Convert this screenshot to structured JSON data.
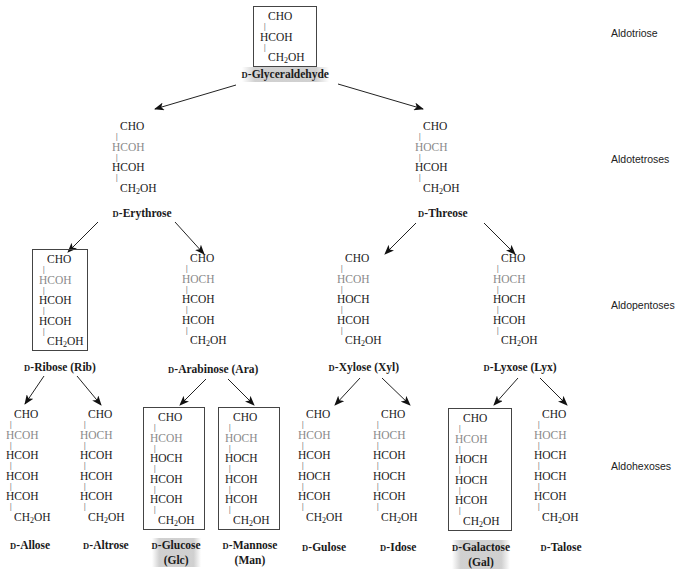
{
  "levels": [
    {
      "label": "Aldotriose",
      "x": 611,
      "y": 27
    },
    {
      "label": "Aldotetroses",
      "x": 611,
      "y": 153
    },
    {
      "label": "Aldopentoses",
      "x": 611,
      "y": 299
    },
    {
      "label": "Aldohexoses",
      "x": 611,
      "y": 460
    }
  ],
  "molecules": [
    {
      "id": "glyceraldehyde",
      "prefix": "D",
      "name": "-Glyceraldehyde",
      "abbr": "",
      "boxed": true,
      "shaded": true,
      "rows": [
        {
          "text": "CHO",
          "h": false,
          "indent": 2
        },
        {
          "text": "HCOH",
          "h": false,
          "indent": 0
        },
        {
          "text": "CH2OH",
          "h": false,
          "indent": 2
        }
      ],
      "x": 253,
      "y": 6,
      "boxw": 64,
      "name_x": 285,
      "name_y": 67
    },
    {
      "id": "erythrose",
      "prefix": "D",
      "name": "-Erythrose",
      "abbr": "",
      "boxed": false,
      "shaded": false,
      "rows": [
        {
          "text": "CHO",
          "h": false,
          "indent": 2
        },
        {
          "text": "HCOH",
          "h": true,
          "indent": 0
        },
        {
          "text": "HCOH",
          "h": false,
          "indent": 0
        },
        {
          "text": "CH2OH",
          "h": false,
          "indent": 2
        }
      ],
      "x": 112,
      "y": 120,
      "boxw": 0,
      "name_x": 142,
      "name_y": 206
    },
    {
      "id": "threose",
      "prefix": "D",
      "name": "-Threose",
      "abbr": "",
      "boxed": false,
      "shaded": false,
      "rows": [
        {
          "text": "CHO",
          "h": false,
          "indent": 2
        },
        {
          "text": "HOCH",
          "h": true,
          "indent": 0
        },
        {
          "text": "HCOH",
          "h": false,
          "indent": 0
        },
        {
          "text": "CH2OH",
          "h": false,
          "indent": 2
        }
      ],
      "x": 415,
      "y": 120,
      "boxw": 0,
      "name_x": 443,
      "name_y": 206
    },
    {
      "id": "ribose",
      "prefix": "D",
      "name": "-Ribose (Rib)",
      "abbr": "",
      "boxed": true,
      "shaded": false,
      "rows": [
        {
          "text": "CHO",
          "h": false,
          "indent": 2
        },
        {
          "text": "HCOH",
          "h": true,
          "indent": 0
        },
        {
          "text": "HCOH",
          "h": false,
          "indent": 0
        },
        {
          "text": "HCOH",
          "h": false,
          "indent": 0
        },
        {
          "text": "CH2OH",
          "h": false,
          "indent": 2
        }
      ],
      "x": 32,
      "y": 249,
      "boxw": 56,
      "name_x": 60,
      "name_y": 360
    },
    {
      "id": "arabinose",
      "prefix": "D",
      "name": "-Arabinose (Ara)",
      "abbr": "",
      "boxed": false,
      "shaded": false,
      "rows": [
        {
          "text": "CHO",
          "h": false,
          "indent": 2
        },
        {
          "text": "HOCH",
          "h": true,
          "indent": 0
        },
        {
          "text": "HCOH",
          "h": false,
          "indent": 0
        },
        {
          "text": "HCOH",
          "h": false,
          "indent": 0
        },
        {
          "text": "CH2OH",
          "h": false,
          "indent": 2
        }
      ],
      "x": 182,
      "y": 252,
      "boxw": 0,
      "name_x": 213,
      "name_y": 362
    },
    {
      "id": "xylose",
      "prefix": "D",
      "name": "-Xylose (Xyl)",
      "abbr": "",
      "boxed": false,
      "shaded": false,
      "rows": [
        {
          "text": "CHO",
          "h": false,
          "indent": 2
        },
        {
          "text": "HCOH",
          "h": true,
          "indent": 0
        },
        {
          "text": "HOCH",
          "h": false,
          "indent": 0
        },
        {
          "text": "HCOH",
          "h": false,
          "indent": 0
        },
        {
          "text": "CH2OH",
          "h": false,
          "indent": 2
        }
      ],
      "x": 337,
      "y": 252,
      "boxw": 0,
      "name_x": 364,
      "name_y": 360
    },
    {
      "id": "lyxose",
      "prefix": "D",
      "name": "-Lyxose (Lyx)",
      "abbr": "",
      "boxed": false,
      "shaded": false,
      "rows": [
        {
          "text": "CHO",
          "h": false,
          "indent": 2
        },
        {
          "text": "HOCH",
          "h": true,
          "indent": 0
        },
        {
          "text": "HOCH",
          "h": false,
          "indent": 0
        },
        {
          "text": "HCOH",
          "h": false,
          "indent": 0
        },
        {
          "text": "CH2OH",
          "h": false,
          "indent": 2
        }
      ],
      "x": 493,
      "y": 252,
      "boxw": 0,
      "name_x": 520,
      "name_y": 360
    },
    {
      "id": "allose",
      "prefix": "D",
      "name": "-Allose",
      "abbr": "",
      "boxed": false,
      "shaded": false,
      "rows": [
        {
          "text": "CHO",
          "h": false,
          "indent": 2
        },
        {
          "text": "HCOH",
          "h": true,
          "indent": 0
        },
        {
          "text": "HCOH",
          "h": false,
          "indent": 0
        },
        {
          "text": "HCOH",
          "h": false,
          "indent": 0
        },
        {
          "text": "HCOH",
          "h": false,
          "indent": 0
        },
        {
          "text": "CH2OH",
          "h": false,
          "indent": 2
        }
      ],
      "x": 6,
      "y": 408,
      "boxw": 0,
      "name_x": 30,
      "name_y": 538
    },
    {
      "id": "altrose",
      "prefix": "D",
      "name": "-Altrose",
      "abbr": "",
      "boxed": false,
      "shaded": false,
      "rows": [
        {
          "text": "CHO",
          "h": false,
          "indent": 2
        },
        {
          "text": "HOCH",
          "h": true,
          "indent": 0
        },
        {
          "text": "HCOH",
          "h": false,
          "indent": 0
        },
        {
          "text": "HCOH",
          "h": false,
          "indent": 0
        },
        {
          "text": "HCOH",
          "h": false,
          "indent": 0
        },
        {
          "text": "CH2OH",
          "h": false,
          "indent": 2
        }
      ],
      "x": 80,
      "y": 408,
      "boxw": 0,
      "name_x": 106,
      "name_y": 538
    },
    {
      "id": "glucose",
      "prefix": "D",
      "name": "-Glucose",
      "abbr": "(Glc)",
      "boxed": true,
      "shaded": true,
      "rows": [
        {
          "text": "CHO",
          "h": false,
          "indent": 2
        },
        {
          "text": "HCOH",
          "h": true,
          "indent": 0
        },
        {
          "text": "HOCH",
          "h": false,
          "indent": 0
        },
        {
          "text": "HCOH",
          "h": false,
          "indent": 0
        },
        {
          "text": "HCOH",
          "h": false,
          "indent": 0
        },
        {
          "text": "CH2OH",
          "h": false,
          "indent": 2
        }
      ],
      "x": 143,
      "y": 407,
      "boxw": 62,
      "name_x": 176,
      "name_y": 538
    },
    {
      "id": "mannose",
      "prefix": "D",
      "name": "-Mannose",
      "abbr": "(Man)",
      "boxed": true,
      "shaded": false,
      "rows": [
        {
          "text": "CHO",
          "h": false,
          "indent": 2
        },
        {
          "text": "HOCH",
          "h": true,
          "indent": 0
        },
        {
          "text": "HOCH",
          "h": false,
          "indent": 0
        },
        {
          "text": "HCOH",
          "h": false,
          "indent": 0
        },
        {
          "text": "HCOH",
          "h": false,
          "indent": 0
        },
        {
          "text": "CH2OH",
          "h": false,
          "indent": 2
        }
      ],
      "x": 218,
      "y": 407,
      "boxw": 62,
      "name_x": 250,
      "name_y": 538
    },
    {
      "id": "gulose",
      "prefix": "D",
      "name": "-Gulose",
      "abbr": "",
      "boxed": false,
      "shaded": false,
      "rows": [
        {
          "text": "CHO",
          "h": false,
          "indent": 2
        },
        {
          "text": "HCOH",
          "h": true,
          "indent": 0
        },
        {
          "text": "HCOH",
          "h": false,
          "indent": 0
        },
        {
          "text": "HOCH",
          "h": false,
          "indent": 0
        },
        {
          "text": "HCOH",
          "h": false,
          "indent": 0
        },
        {
          "text": "CH2OH",
          "h": false,
          "indent": 2
        }
      ],
      "x": 298,
      "y": 408,
      "boxw": 0,
      "name_x": 324,
      "name_y": 540
    },
    {
      "id": "idose",
      "prefix": "D",
      "name": "-Idose",
      "abbr": "",
      "boxed": false,
      "shaded": false,
      "rows": [
        {
          "text": "CHO",
          "h": false,
          "indent": 2
        },
        {
          "text": "HOCH",
          "h": true,
          "indent": 0
        },
        {
          "text": "HCOH",
          "h": false,
          "indent": 0
        },
        {
          "text": "HOCH",
          "h": false,
          "indent": 0
        },
        {
          "text": "HCOH",
          "h": false,
          "indent": 0
        },
        {
          "text": "CH2OH",
          "h": false,
          "indent": 2
        }
      ],
      "x": 373,
      "y": 408,
      "boxw": 0,
      "name_x": 398,
      "name_y": 540
    },
    {
      "id": "galactose",
      "prefix": "D",
      "name": "-Galactose",
      "abbr": "(Gal)",
      "boxed": true,
      "shaded": true,
      "rows": [
        {
          "text": "CHO",
          "h": false,
          "indent": 2
        },
        {
          "text": "HCOH",
          "h": true,
          "indent": 0
        },
        {
          "text": "HOCH",
          "h": false,
          "indent": 0
        },
        {
          "text": "HOCH",
          "h": false,
          "indent": 0
        },
        {
          "text": "HCOH",
          "h": false,
          "indent": 0
        },
        {
          "text": "CH2OH",
          "h": false,
          "indent": 2
        }
      ],
      "x": 448,
      "y": 408,
      "boxw": 64,
      "name_x": 481,
      "name_y": 540
    },
    {
      "id": "talose",
      "prefix": "D",
      "name": "-Talose",
      "abbr": "",
      "boxed": false,
      "shaded": false,
      "rows": [
        {
          "text": "CHO",
          "h": false,
          "indent": 2
        },
        {
          "text": "HOCH",
          "h": true,
          "indent": 0
        },
        {
          "text": "HOCH",
          "h": false,
          "indent": 0
        },
        {
          "text": "HOCH",
          "h": false,
          "indent": 0
        },
        {
          "text": "HCOH",
          "h": false,
          "indent": 0
        },
        {
          "text": "CH2OH",
          "h": false,
          "indent": 2
        }
      ],
      "x": 534,
      "y": 408,
      "boxw": 0,
      "name_x": 561,
      "name_y": 540
    }
  ],
  "arrows": [
    {
      "from": "glyceraldehyde",
      "x1": 236,
      "y1": 85,
      "x2": 155,
      "y2": 109
    },
    {
      "from": "glyceraldehyde",
      "x1": 338,
      "y1": 84,
      "x2": 423,
      "y2": 109
    },
    {
      "from": "erythrose",
      "x1": 98,
      "y1": 222,
      "x2": 68,
      "y2": 252
    },
    {
      "from": "erythrose",
      "x1": 175,
      "y1": 222,
      "x2": 204,
      "y2": 254
    },
    {
      "from": "threose",
      "x1": 416,
      "y1": 223,
      "x2": 385,
      "y2": 254
    },
    {
      "from": "threose",
      "x1": 484,
      "y1": 223,
      "x2": 515,
      "y2": 254
    },
    {
      "from": "ribose",
      "x1": 44,
      "y1": 376,
      "x2": 25,
      "y2": 404
    },
    {
      "from": "ribose",
      "x1": 77,
      "y1": 376,
      "x2": 101,
      "y2": 405
    },
    {
      "from": "arabinose",
      "x1": 206,
      "y1": 379,
      "x2": 180,
      "y2": 405
    },
    {
      "from": "arabinose",
      "x1": 228,
      "y1": 379,
      "x2": 254,
      "y2": 405
    },
    {
      "from": "xylose",
      "x1": 360,
      "y1": 378,
      "x2": 335,
      "y2": 405
    },
    {
      "from": "xylose",
      "x1": 382,
      "y1": 378,
      "x2": 410,
      "y2": 405
    },
    {
      "from": "lyxose",
      "x1": 518,
      "y1": 378,
      "x2": 494,
      "y2": 405
    },
    {
      "from": "lyxose",
      "x1": 540,
      "y1": 378,
      "x2": 567,
      "y2": 405
    }
  ],
  "colors": {
    "text": "#1a1a1a",
    "highlight_carbon": "#8a8a8a",
    "box_border": "#444444",
    "shade": "#aaaaaa"
  }
}
